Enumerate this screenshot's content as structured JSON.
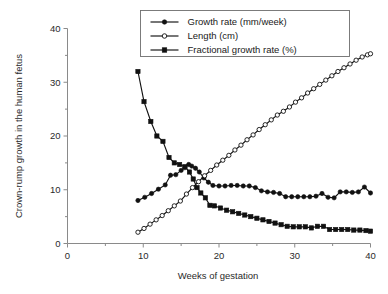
{
  "chart_data": {
    "type": "line",
    "title": "",
    "xlabel": "Weeks of gestation",
    "ylabel": "Crown-rump growth in the human fetus",
    "xlim": [
      0,
      40
    ],
    "ylim": [
      0,
      40
    ],
    "xticks": [
      0,
      10,
      20,
      30,
      40
    ],
    "yticks": [
      0,
      10,
      20,
      30,
      40
    ],
    "xticklabels": [
      "0",
      "10",
      "20",
      "30",
      "40"
    ],
    "yticklabels": [
      "0",
      "10",
      "20",
      "30",
      "40"
    ],
    "xminorticks": [
      5,
      15,
      25,
      35
    ],
    "yminorticks": [
      5,
      15,
      25,
      35
    ],
    "grid": false,
    "legend_position": "top-center",
    "series": [
      {
        "name": "Growth rate (mm/week)",
        "marker": "filled-circle",
        "x": [
          9.3,
          10.2,
          11.1,
          12.0,
          12.9,
          13.6,
          14.3,
          15.0,
          15.5,
          16.0,
          16.4,
          16.9,
          17.4,
          18.0,
          18.6,
          19.2,
          20.0,
          20.8,
          21.6,
          22.4,
          23.2,
          24.0,
          24.8,
          25.6,
          26.4,
          27.2,
          28.0,
          28.8,
          29.6,
          30.4,
          31.2,
          32.0,
          32.8,
          33.6,
          34.4,
          35.2,
          36.0,
          36.8,
          37.6,
          38.4,
          39.2,
          40.0
        ],
        "values": [
          8.0,
          8.6,
          9.3,
          10.1,
          10.9,
          12.7,
          12.8,
          13.6,
          14.1,
          14.7,
          14.4,
          14.0,
          13.3,
          12.2,
          11.4,
          10.8,
          10.7,
          10.7,
          10.8,
          10.8,
          10.7,
          10.7,
          10.4,
          9.8,
          9.6,
          9.5,
          9.3,
          8.7,
          8.7,
          8.7,
          8.7,
          8.7,
          8.8,
          9.3,
          8.6,
          8.5,
          9.6,
          9.6,
          9.5,
          9.6,
          10.5,
          9.4
        ]
      },
      {
        "name": "Length (cm)",
        "marker": "open-circle",
        "x": [
          9.3,
          10.1,
          10.9,
          11.7,
          12.5,
          13.3,
          14.1,
          14.9,
          15.7,
          16.5,
          17.3,
          18.1,
          18.9,
          19.7,
          20.5,
          21.3,
          22.1,
          22.9,
          23.7,
          24.5,
          25.3,
          26.1,
          26.9,
          27.7,
          28.5,
          29.3,
          30.1,
          30.9,
          31.7,
          32.5,
          33.3,
          34.1,
          34.9,
          35.7,
          36.5,
          37.3,
          38.1,
          38.9,
          39.6,
          40.0
        ],
        "values": [
          2.1,
          2.8,
          3.6,
          4.4,
          5.2,
          6.1,
          7.0,
          7.9,
          9.2,
          10.4,
          11.5,
          12.6,
          13.6,
          14.6,
          15.5,
          16.4,
          17.4,
          18.3,
          19.3,
          20.2,
          21.2,
          22.1,
          23.0,
          23.9,
          24.6,
          25.4,
          26.3,
          27.1,
          28.0,
          28.8,
          29.6,
          30.4,
          31.2,
          32.0,
          32.7,
          33.4,
          34.1,
          34.7,
          35.1,
          35.3
        ]
      },
      {
        "name": "Fractional growth rate (%)",
        "marker": "filled-square",
        "x": [
          9.3,
          10.1,
          11.0,
          11.8,
          12.6,
          13.4,
          14.1,
          14.8,
          15.5,
          16.1,
          16.6,
          17.1,
          17.6,
          18.2,
          18.8,
          19.4,
          20.2,
          21.0,
          21.8,
          22.6,
          23.4,
          24.2,
          25.0,
          25.8,
          26.6,
          27.4,
          28.2,
          29.0,
          29.8,
          30.6,
          31.4,
          32.2,
          33.0,
          33.8,
          34.6,
          35.4,
          36.2,
          37.0,
          37.8,
          38.6,
          39.4,
          40.0
        ],
        "values": [
          32.0,
          26.4,
          22.7,
          20.0,
          19.0,
          16.0,
          15.0,
          14.7,
          14.3,
          13.3,
          12.0,
          10.4,
          9.4,
          8.5,
          7.1,
          7.0,
          6.6,
          6.2,
          5.9,
          5.6,
          5.3,
          5.0,
          4.7,
          4.4,
          4.1,
          3.8,
          3.5,
          3.2,
          3.1,
          3.1,
          3.1,
          2.9,
          3.2,
          3.2,
          2.6,
          2.6,
          2.6,
          2.6,
          2.5,
          2.5,
          2.4,
          2.3
        ]
      }
    ]
  },
  "legend": {
    "entries": [
      {
        "label": "Growth rate (mm/week)",
        "marker": "filled-circle"
      },
      {
        "label": "Length (cm)",
        "marker": "open-circle"
      },
      {
        "label": "Fractional growth rate (%)",
        "marker": "filled-square"
      }
    ]
  },
  "colors": {
    "line": "#111111",
    "axis": "#8a8a8a",
    "legend_border": "#6e6e6e",
    "background": "#ffffff",
    "text": "#1a1a1a"
  }
}
